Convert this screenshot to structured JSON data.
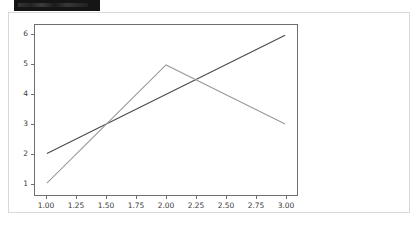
{
  "window": {
    "topbar_label": ""
  },
  "chart_data": {
    "type": "line",
    "title": "",
    "xlabel": "",
    "ylabel": "",
    "xlim": [
      0.9,
      3.1
    ],
    "ylim": [
      0.6,
      6.35
    ],
    "grid": false,
    "legend": null,
    "xticks": [
      1.0,
      1.25,
      1.5,
      1.75,
      2.0,
      2.25,
      2.5,
      2.75,
      3.0
    ],
    "xticklabels": [
      "1.00",
      "1.25",
      "1.50",
      "1.75",
      "2.00",
      "2.25",
      "2.50",
      "2.75",
      "3.00"
    ],
    "yticks": [
      1,
      2,
      3,
      4,
      5,
      6
    ],
    "yticklabels": [
      "1",
      "2",
      "3",
      "4",
      "5",
      "6"
    ],
    "x": [
      1.0,
      2.0,
      3.0
    ],
    "series": [
      {
        "name": "series-1",
        "color": "#4a4a4a",
        "x": [
          1.0,
          3.0
        ],
        "values": [
          2,
          6
        ]
      },
      {
        "name": "series-2",
        "color": "#9a9a9a",
        "x": [
          1.0,
          2.0,
          3.0
        ],
        "values": [
          1,
          5,
          3
        ]
      }
    ],
    "colors": {
      "axis": "#6e6e6e",
      "tick_text": "#3c3c3c",
      "background": "#ffffff",
      "card_border": "#d8d8d8",
      "topbar": "#151515"
    }
  }
}
